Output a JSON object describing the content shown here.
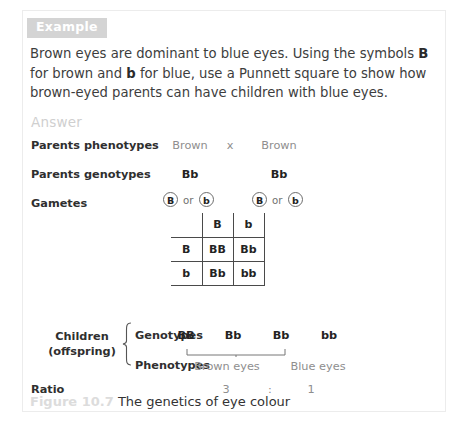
{
  "badge": {
    "label": "Example"
  },
  "question": {
    "part1": "Brown eyes are dominant to blue eyes. Using the symbols ",
    "symbol_dominant": "B",
    "part2": " for brown and ",
    "symbol_recessive": "b",
    "part3": " for blue, use a Punnett square to show how brown-eyed parents can have children with blue eyes."
  },
  "answer": {
    "label": "Answer"
  },
  "rows": {
    "parents_phenotypes": {
      "label": "Parents phenotypes",
      "left": "Brown",
      "operator": "x",
      "right": "Brown"
    },
    "parents_genotypes": {
      "label": "Parents genotypes",
      "left": "Bb",
      "right": "Bb"
    },
    "gametes": {
      "label": "Gametes",
      "or": "or",
      "parent1": [
        "B",
        "b"
      ],
      "parent2": [
        "B",
        "b"
      ]
    },
    "ratio": {
      "label": "Ratio",
      "left": "3",
      "separator": ":",
      "right": "1"
    }
  },
  "punnett": {
    "corner": "",
    "col_headers": [
      "B",
      "b"
    ],
    "row_headers": [
      "B",
      "b"
    ],
    "cells": [
      [
        "BB",
        "Bb"
      ],
      [
        "Bb",
        "bb"
      ]
    ]
  },
  "children": {
    "line1": "Children",
    "line2": "(offspring)",
    "genotypes_label": "Genotypes",
    "phenotypes_label": "Phenotypes",
    "genotypes": [
      "BB",
      "Bb",
      "Bb",
      "bb"
    ],
    "phenotypes": [
      "Brown eyes",
      "Blue eyes"
    ]
  },
  "caption": {
    "figure_number": "Figure 10.7",
    "text": "The genetics of eye colour"
  },
  "colors": {
    "badge_bg": "#d4d4d4",
    "badge_text": "#ffffff",
    "body_text": "#3d3d3d",
    "muted_text": "#8e8e8e",
    "grid_line": "#4a4a4a",
    "page_border": "#ececec"
  }
}
